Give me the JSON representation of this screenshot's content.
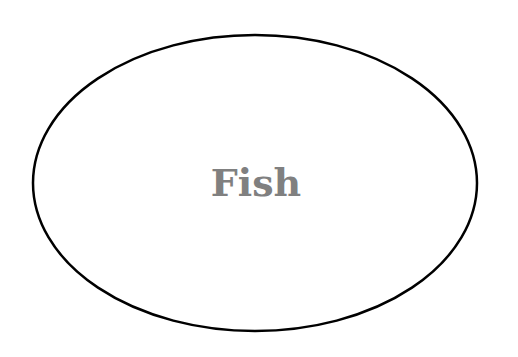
{
  "diagram": {
    "shape": "ellipse",
    "label": "Fish",
    "colors": {
      "stroke": "#000000",
      "fill": "#ffffff",
      "text": "#808080"
    }
  }
}
